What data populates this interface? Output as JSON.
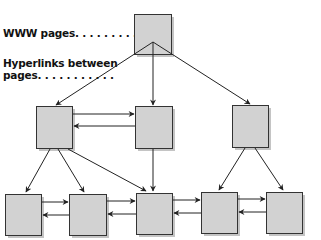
{
  "labels": {
    "www_pages": "WWW pages. . . . . . . . . . . . .",
    "hyperlinks_line1": "Hyperlinks between",
    "hyperlinks_line2": "pages. . . . . . . . . . ."
  },
  "colors": {
    "box_fill": "#d2d2d2",
    "box_stroke": "#333333",
    "shadow": "#bdbdbd",
    "arrow": "#222222"
  },
  "nodes": [
    {
      "id": "root",
      "x": 134,
      "y": 14,
      "w": 37,
      "h": 40
    },
    {
      "id": "l2-left",
      "x": 36,
      "y": 106,
      "w": 36,
      "h": 42
    },
    {
      "id": "l2-mid",
      "x": 135,
      "y": 106,
      "w": 37,
      "h": 42
    },
    {
      "id": "l2-right",
      "x": 232,
      "y": 105,
      "w": 36,
      "h": 42
    },
    {
      "id": "l3-1",
      "x": 5,
      "y": 194,
      "w": 36,
      "h": 41
    },
    {
      "id": "l3-2",
      "x": 69,
      "y": 194,
      "w": 37,
      "h": 41
    },
    {
      "id": "l3-3",
      "x": 136,
      "y": 193,
      "w": 36,
      "h": 41
    },
    {
      "id": "l3-4",
      "x": 201,
      "y": 192,
      "w": 36,
      "h": 41
    },
    {
      "id": "l3-5",
      "x": 266,
      "y": 192,
      "w": 36,
      "h": 41
    }
  ]
}
